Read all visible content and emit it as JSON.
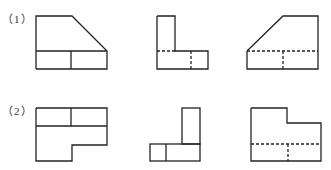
{
  "problems": [
    {
      "label": "（1）",
      "views": [
        {
          "name": "front-view",
          "shape": "trapezoid with slanted right top edge, divided bottom band"
        },
        {
          "name": "side-view",
          "shape": "L-shape with hidden lines"
        },
        {
          "name": "top-view",
          "shape": "trapezoid with slanted left top edge, hidden lines"
        }
      ]
    },
    {
      "label": "（2）",
      "views": [
        {
          "name": "front-view",
          "shape": "stepped block with divided top band"
        },
        {
          "name": "side-view",
          "shape": "inverted L of rectangles"
        },
        {
          "name": "top-view",
          "shape": "stepped outline with hidden lines"
        }
      ]
    }
  ],
  "colors": {
    "line": "#222222",
    "background": "#ffffff"
  }
}
